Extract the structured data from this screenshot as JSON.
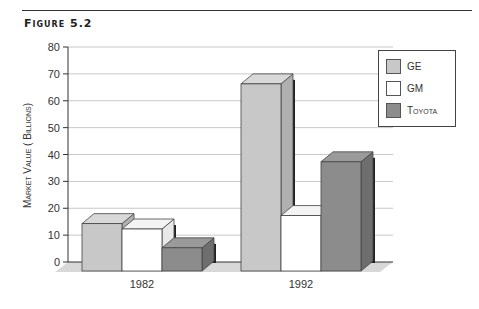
{
  "figure_label": "Figure 5.2",
  "chart_data": {
    "type": "bar",
    "title": "",
    "categories": [
      "1982",
      "1992"
    ],
    "series": [
      {
        "name": "GE",
        "values": [
          18,
          70
        ],
        "color": "#c8c8c8"
      },
      {
        "name": "GM",
        "values": [
          16,
          21
        ],
        "color": "#ffffff"
      },
      {
        "name": "Toyota",
        "values": [
          9,
          41
        ],
        "color": "#8c8c8c"
      }
    ],
    "xlabel": "",
    "ylabel": "Market Value ( Billions)",
    "ylim": [
      0,
      80
    ],
    "yticks": [
      "0",
      "10",
      "20",
      "30",
      "40",
      "50",
      "60",
      "70",
      "80"
    ],
    "grid": true,
    "legend_position": "top-right",
    "style": "3d"
  }
}
